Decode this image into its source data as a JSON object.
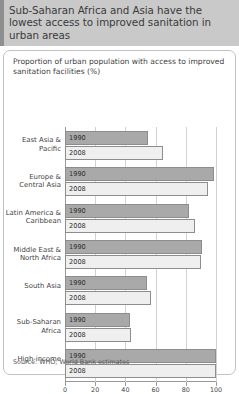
{
  "header": {
    "title": "Sub-Saharan Africa and Asia have the lowest access to improved sanitation in urban areas"
  },
  "panel": {
    "subtitle": "Proportion of urban population with access to improved sanitation facilities (%)",
    "source": "Source: WHO; World Bank estimates"
  },
  "colors": {
    "header_band": "#c9c9c9",
    "header_stripe": "#8f8f8f",
    "bar_1990": "#a9a9a9",
    "bar_2008": "#efefef",
    "bar_border": "#8d8d8d",
    "grid": "#d2d2d2",
    "axis": "#9a9a9a"
  },
  "chart_data": {
    "type": "bar",
    "orientation": "horizontal",
    "title": "Sub-Saharan Africa and Asia have the lowest access to improved sanitation in urban areas",
    "subtitle": "Proportion of urban population with access to improved sanitation facilities (%)",
    "xlabel": "",
    "ylabel": "",
    "xlim": [
      0,
      100
    ],
    "xticks": [
      0,
      20,
      40,
      60,
      80,
      100
    ],
    "xtick_labels": [
      "0",
      "20",
      "40",
      "60",
      "80",
      "100"
    ],
    "grid": true,
    "legend": false,
    "source": "Source: WHO; World Bank estimates",
    "categories": [
      "East Asia &\nPacific",
      "Europe &\nCentral Asia",
      "Latin America &\nCaribbean",
      "Middle East &\nNorth Africa",
      "South Asia",
      "Sub-Saharan\nAfrica",
      "High-income"
    ],
    "series": [
      {
        "name": "1990",
        "values": [
          55,
          99,
          82,
          91,
          54,
          43,
          100
        ]
      },
      {
        "name": "2008",
        "values": [
          65,
          95,
          86,
          90,
          57,
          44,
          100
        ]
      }
    ]
  }
}
